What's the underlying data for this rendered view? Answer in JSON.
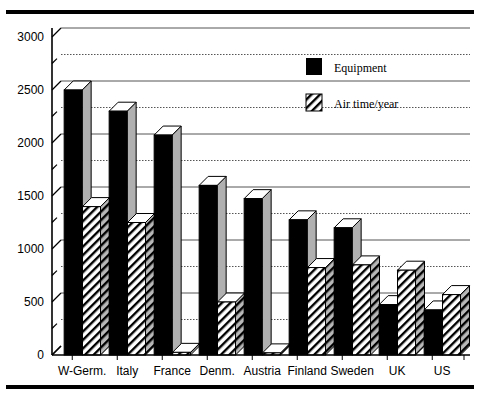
{
  "chart_data": {
    "type": "bar",
    "title": "",
    "subtitle": "",
    "xlabel": "",
    "ylabel": "",
    "ylim": [
      0,
      3000
    ],
    "yticks": [
      0,
      500,
      1000,
      1500,
      2000,
      2500,
      3000
    ],
    "ytick_labels": [
      "0",
      "500",
      "1000",
      "1500",
      "2000",
      "2500",
      "3000"
    ],
    "minor_tick_step": 250,
    "grid": true,
    "grid_orientation": "horizontal",
    "legend_position": "top-right",
    "style": "3d-bars-bw",
    "categories": [
      "W-Germ.",
      "Italy",
      "France",
      "Denm.",
      "Austria",
      "Finland",
      "Sweden",
      "UK",
      "US"
    ],
    "series": [
      {
        "name": "Equipment",
        "fill": "solid-black",
        "color": "#000000",
        "values": [
          2500,
          2300,
          2075,
          1600,
          1475,
          1275,
          1200,
          475,
          425
        ]
      },
      {
        "name": "Air time/year",
        "fill": "diagonal-hatch",
        "color": "#ffffff",
        "values": [
          1400,
          1250,
          25,
          500,
          20,
          825,
          850,
          800,
          570
        ]
      }
    ]
  },
  "legend": {
    "items": [
      {
        "label": "Equipment",
        "swatch": "solid-black-swatch"
      },
      {
        "label": "Air time/year",
        "swatch": "hatched-swatch"
      }
    ]
  },
  "axis": {
    "y_axis_name": "value-axis",
    "x_axis_name": "category-axis",
    "break_marker": "axis-break"
  },
  "colors": {
    "ink": "#000000",
    "paper": "#ffffff",
    "bar_side": "#b0b0b0",
    "grid": "#555555"
  }
}
